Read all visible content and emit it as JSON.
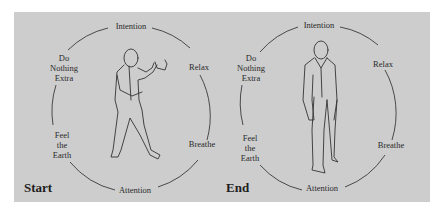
{
  "diagrams": [
    {
      "caption": "Start",
      "figure": "person-in-stance-hands-raised",
      "labels": {
        "top": "Intention",
        "upper_left": [
          "Do",
          "Nothing",
          "Extra"
        ],
        "upper_right": "Relax",
        "lower_left": [
          "Feel",
          "the",
          "Earth"
        ],
        "lower_right": "Breathe",
        "bottom": "Attention"
      }
    },
    {
      "caption": "End",
      "figure": "person-standing-relaxed",
      "labels": {
        "top": "Intention",
        "upper_left": [
          "Do",
          "Nothing",
          "Extra"
        ],
        "upper_right": "Relax",
        "lower_left": [
          "Feel",
          "the",
          "Earth"
        ],
        "lower_right": "Breathe",
        "bottom": "Attention"
      }
    }
  ],
  "colors": {
    "panel": "#cdcdcd",
    "ink": "#2a2a2a",
    "background": "#ffffff"
  }
}
